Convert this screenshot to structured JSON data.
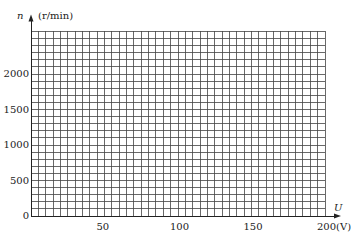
{
  "chart_data": {
    "type": "line",
    "title": "",
    "xlabel": "U",
    "xunit": "(V)",
    "ylabel": "n",
    "yunit": "(r/min)",
    "x_ticks": [
      "50",
      "100",
      "150",
      "200"
    ],
    "y_ticks": [
      "0",
      "500",
      "1000",
      "1500",
      "2000"
    ],
    "xlim": [
      0,
      200
    ],
    "ylim": [
      0,
      2600
    ],
    "grid": true,
    "grid_x_step": 5,
    "grid_y_step": 100,
    "series": []
  },
  "labels": {
    "y_axis_name": "n",
    "y_axis_unit": "(r/min)",
    "x_axis_name": "U",
    "x_last_tick_with_unit": "200(V)",
    "origin": "0"
  }
}
